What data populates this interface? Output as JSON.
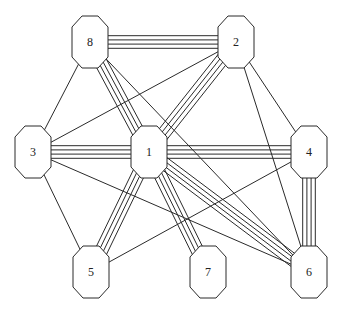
{
  "diagram": {
    "type": "multigraph",
    "node_shape": "octagon",
    "node_size": {
      "w": 36,
      "h": 52
    },
    "line_spacing": 4.2,
    "colors": {
      "stroke": "#2a2a2a",
      "fill": "#ffffff",
      "label": "#222222"
    },
    "nodes": [
      {
        "id": "1",
        "label": "1",
        "x": 149,
        "y": 152
      },
      {
        "id": "2",
        "label": "2",
        "x": 236,
        "y": 42
      },
      {
        "id": "3",
        "label": "3",
        "x": 33,
        "y": 152
      },
      {
        "id": "4",
        "label": "4",
        "x": 309,
        "y": 152
      },
      {
        "id": "5",
        "label": "5",
        "x": 91,
        "y": 272
      },
      {
        "id": "6",
        "label": "6",
        "x": 309,
        "y": 272
      },
      {
        "id": "7",
        "label": "7",
        "x": 208,
        "y": 272
      },
      {
        "id": "8",
        "label": "8",
        "x": 90,
        "y": 42
      }
    ],
    "edges": [
      {
        "from": "8",
        "to": "2",
        "multiplicity": 4
      },
      {
        "from": "8",
        "to": "1",
        "multiplicity": 4
      },
      {
        "from": "8",
        "to": "3",
        "multiplicity": 1
      },
      {
        "from": "8",
        "to": "6",
        "multiplicity": 1
      },
      {
        "from": "2",
        "to": "1",
        "multiplicity": 4
      },
      {
        "from": "2",
        "to": "3",
        "multiplicity": 1
      },
      {
        "from": "2",
        "to": "4",
        "multiplicity": 1
      },
      {
        "from": "2",
        "to": "6",
        "multiplicity": 1
      },
      {
        "from": "3",
        "to": "1",
        "multiplicity": 4
      },
      {
        "from": "3",
        "to": "5",
        "multiplicity": 1
      },
      {
        "from": "3",
        "to": "6",
        "multiplicity": 1
      },
      {
        "from": "1",
        "to": "4",
        "multiplicity": 4
      },
      {
        "from": "1",
        "to": "5",
        "multiplicity": 4
      },
      {
        "from": "1",
        "to": "7",
        "multiplicity": 4
      },
      {
        "from": "1",
        "to": "6",
        "multiplicity": 4
      },
      {
        "from": "4",
        "to": "6",
        "multiplicity": 4
      },
      {
        "from": "4",
        "to": "5",
        "multiplicity": 1
      }
    ]
  }
}
